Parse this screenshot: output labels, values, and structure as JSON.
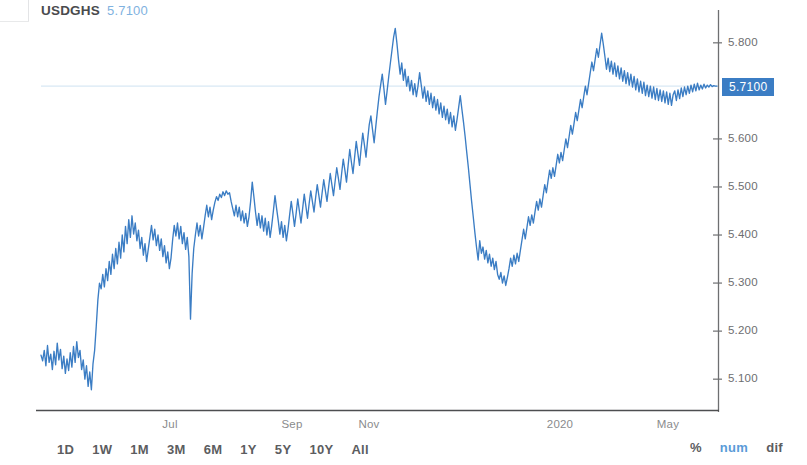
{
  "header": {
    "symbol": "USDGHS",
    "price": "5.7100"
  },
  "axis": {
    "y_ticks": [
      "5.800",
      "5.600",
      "5.500",
      "5.400",
      "5.300",
      "5.200",
      "5.100"
    ],
    "x_ticks": [
      "Jul",
      "Sep",
      "Nov",
      "2020",
      "May"
    ],
    "price_tag": "5.7100"
  },
  "toolbar": {
    "ranges": [
      "1D",
      "1W",
      "1M",
      "3M",
      "6M",
      "1Y",
      "5Y",
      "10Y",
      "All"
    ],
    "modes": [
      {
        "label": "%",
        "active": false
      },
      {
        "label": "num",
        "active": true
      },
      {
        "label": "dif",
        "active": false
      }
    ]
  },
  "colors": {
    "line": "#3b7dc4",
    "price_tag_bg": "#3b7dc4",
    "price_level_line": "#d8e8f4",
    "axis": "#6e6f71",
    "text": "#58595b",
    "accent_light": "#7fb2e0"
  },
  "chart_data": {
    "type": "line",
    "title": "USDGHS",
    "xlabel": "",
    "ylabel": "",
    "ylim": [
      5.04,
      5.86
    ],
    "grid": false,
    "legend": "none",
    "current_price": 5.71,
    "y_ticks": [
      5.8,
      5.6,
      5.5,
      5.4,
      5.3,
      5.2,
      5.1
    ],
    "x_ticks": [
      "Jul",
      "Sep",
      "Nov",
      "2020",
      "May"
    ],
    "series": [
      {
        "name": "USDGHS",
        "values": [
          5.15,
          5.138,
          5.16,
          5.128,
          5.17,
          5.135,
          5.152,
          5.12,
          5.158,
          5.13,
          5.175,
          5.14,
          5.162,
          5.122,
          5.148,
          5.112,
          5.142,
          5.118,
          5.155,
          5.125,
          5.168,
          5.135,
          5.178,
          5.145,
          5.16,
          5.12,
          5.14,
          5.1,
          5.128,
          5.085,
          5.115,
          5.078,
          5.132,
          5.16,
          5.21,
          5.265,
          5.3,
          5.288,
          5.318,
          5.292,
          5.33,
          5.305,
          5.345,
          5.318,
          5.36,
          5.33,
          5.372,
          5.34,
          5.385,
          5.352,
          5.4,
          5.365,
          5.418,
          5.382,
          5.432,
          5.395,
          5.44,
          5.402,
          5.425,
          5.388,
          5.41,
          5.372,
          5.395,
          5.358,
          5.382,
          5.345,
          5.37,
          5.395,
          5.42,
          5.39,
          5.412,
          5.378,
          5.4,
          5.368,
          5.392,
          5.355,
          5.378,
          5.342,
          5.365,
          5.33,
          5.352,
          5.39,
          5.42,
          5.398,
          5.425,
          5.392,
          5.418,
          5.382,
          5.405,
          5.37,
          5.395,
          5.355,
          5.225,
          5.32,
          5.372,
          5.4,
          5.425,
          5.398,
          5.42,
          5.392,
          5.415,
          5.44,
          5.462,
          5.438,
          5.458,
          5.432,
          5.452,
          5.468,
          5.48,
          5.472,
          5.485,
          5.478,
          5.49,
          5.482,
          5.492,
          5.485,
          5.488,
          5.47,
          5.455,
          5.44,
          5.462,
          5.438,
          5.458,
          5.43,
          5.45,
          5.425,
          5.445,
          5.418,
          5.438,
          5.47,
          5.51,
          5.48,
          5.448,
          5.42,
          5.445,
          5.415,
          5.44,
          5.408,
          5.435,
          5.4,
          5.428,
          5.395,
          5.42,
          5.45,
          5.482,
          5.455,
          5.43,
          5.402,
          5.428,
          5.395,
          5.42,
          5.388,
          5.412,
          5.442,
          5.47,
          5.445,
          5.418,
          5.445,
          5.475,
          5.45,
          5.425,
          5.455,
          5.485,
          5.46,
          5.435,
          5.465,
          5.492,
          5.47,
          5.448,
          5.478,
          5.505,
          5.482,
          5.458,
          5.488,
          5.515,
          5.492,
          5.47,
          5.5,
          5.528,
          5.505,
          5.482,
          5.512,
          5.54,
          5.518,
          5.495,
          5.528,
          5.558,
          5.535,
          5.51,
          5.545,
          5.578,
          5.552,
          5.528,
          5.562,
          5.595,
          5.57,
          5.545,
          5.58,
          5.612,
          5.588,
          5.562,
          5.598,
          5.63,
          5.648,
          5.62,
          5.592,
          5.625,
          5.658,
          5.688,
          5.712,
          5.735,
          5.705,
          5.672,
          5.7,
          5.73,
          5.758,
          5.785,
          5.812,
          5.83,
          5.8,
          5.765,
          5.735,
          5.758,
          5.722,
          5.745,
          5.71,
          5.73,
          5.7,
          5.722,
          5.692,
          5.715,
          5.688,
          5.71,
          5.738,
          5.712,
          5.685,
          5.708,
          5.678,
          5.7,
          5.672,
          5.695,
          5.665,
          5.688,
          5.66,
          5.682,
          5.652,
          5.675,
          5.645,
          5.668,
          5.64,
          5.662,
          5.632,
          5.655,
          5.625,
          5.648,
          5.618,
          5.64,
          5.665,
          5.69,
          5.662,
          5.635,
          5.605,
          5.572,
          5.54,
          5.505,
          5.47,
          5.438,
          5.405,
          5.375,
          5.348,
          5.388,
          5.362,
          5.375,
          5.35,
          5.368,
          5.342,
          5.36,
          5.335,
          5.352,
          5.328,
          5.345,
          5.318,
          5.308,
          5.322,
          5.3,
          5.315,
          5.295,
          5.312,
          5.33,
          5.352,
          5.335,
          5.358,
          5.34,
          5.362,
          5.345,
          5.368,
          5.39,
          5.412,
          5.392,
          5.415,
          5.438,
          5.42,
          5.442,
          5.425,
          5.448,
          5.47,
          5.452,
          5.475,
          5.458,
          5.482,
          5.505,
          5.488,
          5.512,
          5.535,
          5.518,
          5.54,
          5.522,
          5.545,
          5.568,
          5.55,
          5.572,
          5.555,
          5.578,
          5.6,
          5.582,
          5.605,
          5.628,
          5.61,
          5.632,
          5.655,
          5.638,
          5.66,
          5.682,
          5.665,
          5.688,
          5.71,
          5.692,
          5.715,
          5.738,
          5.76,
          5.742,
          5.765,
          5.788,
          5.77,
          5.795,
          5.82,
          5.798,
          5.772,
          5.745,
          5.768,
          5.74,
          5.762,
          5.735,
          5.758,
          5.73,
          5.752,
          5.725,
          5.748,
          5.72,
          5.742,
          5.715,
          5.738,
          5.712,
          5.735,
          5.708,
          5.73,
          5.702,
          5.725,
          5.698,
          5.72,
          5.695,
          5.718,
          5.69,
          5.712,
          5.688,
          5.71,
          5.685,
          5.708,
          5.682,
          5.705,
          5.68,
          5.702,
          5.678,
          5.7,
          5.675,
          5.698,
          5.672,
          5.695,
          5.67,
          5.692,
          5.7,
          5.68,
          5.702,
          5.684,
          5.706,
          5.688,
          5.708,
          5.692,
          5.71,
          5.695,
          5.712,
          5.698,
          5.714,
          5.7,
          5.716,
          5.702,
          5.712,
          5.704,
          5.714,
          5.706,
          5.712,
          5.708,
          5.713,
          5.709,
          5.711,
          5.71,
          5.71
        ]
      }
    ]
  }
}
